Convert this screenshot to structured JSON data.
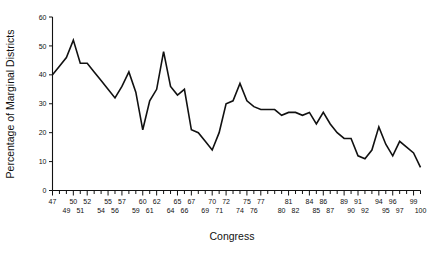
{
  "chart_data": {
    "type": "line",
    "title": "",
    "subtitle": "",
    "xlabel": "Congress",
    "ylabel": "Percentage of Marginal Districts",
    "xlim": [
      47,
      100
    ],
    "ylim": [
      0,
      60
    ],
    "grid": false,
    "legend": null,
    "y_ticks": [
      0,
      10,
      20,
      30,
      40,
      50,
      60
    ],
    "y_tick_labels": [
      "0",
      "10",
      "20",
      "30",
      "40",
      "50",
      "60"
    ],
    "x_ticks": [
      47,
      48,
      49,
      50,
      51,
      52,
      53,
      54,
      55,
      56,
      57,
      58,
      59,
      60,
      61,
      62,
      63,
      64,
      65,
      66,
      67,
      68,
      69,
      70,
      71,
      72,
      73,
      74,
      75,
      76,
      77,
      78,
      79,
      80,
      81,
      82,
      83,
      84,
      85,
      86,
      87,
      88,
      89,
      90,
      91,
      92,
      93,
      94,
      95,
      96,
      97,
      98,
      99,
      100
    ],
    "x_tick_labels_upper": [
      "47",
      "50",
      "52",
      "55",
      "57",
      "60",
      "62",
      "65",
      "67",
      "70",
      "72",
      "75",
      "77",
      "81",
      "84",
      "86",
      "89",
      "91",
      "94",
      "96",
      "99"
    ],
    "x_tick_labels_lower": [
      "49",
      "51",
      "54",
      "56",
      "59",
      "61",
      "64",
      "66",
      "69",
      "71",
      "74",
      "76",
      "80",
      "82",
      "85",
      "87",
      "90",
      "92",
      "95",
      "97",
      "100"
    ],
    "x_tick_label_positions_upper": [
      47,
      50,
      52,
      55,
      57,
      60,
      62,
      65,
      67,
      70,
      72,
      75,
      77,
      81,
      84,
      86,
      89,
      91,
      94,
      96,
      99
    ],
    "x_tick_label_positions_lower": [
      49,
      51,
      54,
      56,
      59,
      61,
      64,
      66,
      69,
      71,
      74,
      76,
      80,
      82,
      85,
      87,
      90,
      92,
      95,
      97,
      100
    ],
    "categories": [
      47,
      48,
      49,
      50,
      51,
      52,
      53,
      54,
      55,
      56,
      57,
      58,
      59,
      60,
      61,
      62,
      63,
      64,
      65,
      66,
      67,
      68,
      69,
      70,
      71,
      72,
      73,
      74,
      75,
      76,
      77,
      78,
      79,
      80,
      81,
      82,
      83,
      84,
      85,
      86,
      87,
      88,
      89,
      90,
      91,
      92,
      93,
      94,
      95,
      96,
      97,
      98,
      99,
      100
    ],
    "values": [
      40,
      43,
      46,
      52,
      44,
      44,
      41,
      38,
      35,
      32,
      36,
      41,
      34,
      21,
      31,
      35,
      48,
      36,
      33,
      35,
      21,
      20,
      17,
      14,
      20,
      30,
      31,
      37,
      31,
      29,
      28,
      28,
      28,
      26,
      27,
      27,
      26,
      27,
      23,
      27,
      23,
      20,
      18,
      18,
      12,
      11,
      14,
      22,
      16,
      12,
      17,
      15,
      13,
      8
    ],
    "series": [
      {
        "name": "Percentage of Marginal Districts",
        "color": "#111111",
        "values": [
          40,
          43,
          46,
          52,
          44,
          44,
          41,
          38,
          35,
          32,
          36,
          41,
          34,
          21,
          31,
          35,
          48,
          36,
          33,
          35,
          21,
          20,
          17,
          14,
          20,
          30,
          31,
          37,
          31,
          29,
          28,
          28,
          28,
          26,
          27,
          27,
          26,
          27,
          23,
          27,
          23,
          20,
          18,
          18,
          12,
          11,
          14,
          22,
          16,
          12,
          17,
          15,
          13,
          8
        ]
      }
    ],
    "annotations": []
  },
  "figure": {
    "background_color": "#ffffff",
    "line_color": "#111111",
    "axis_color": "#111111"
  }
}
